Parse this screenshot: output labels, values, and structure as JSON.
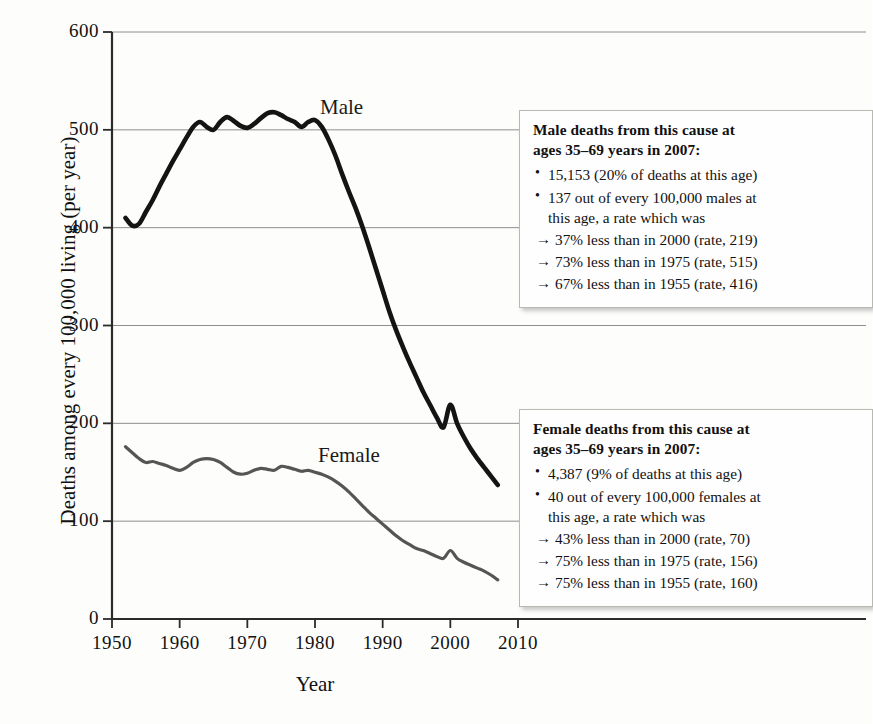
{
  "chart_data": {
    "type": "line",
    "title": "",
    "xlabel": "Year",
    "ylabel": "Deaths among every 100,000 living (per year)",
    "xlim": [
      1950,
      2012
    ],
    "ylim": [
      0,
      600
    ],
    "xticks": [
      "1950",
      "1960",
      "1970",
      "1980",
      "1990",
      "2000",
      "2010"
    ],
    "yticks": [
      "0",
      "100",
      "200",
      "300",
      "400",
      "500",
      "600"
    ],
    "grid": "horizontal",
    "legend_position": "inline-labels",
    "series": [
      {
        "name": "Male",
        "color": "#141414",
        "x": [
          1952,
          1953,
          1954,
          1955,
          1956,
          1957,
          1958,
          1959,
          1960,
          1961,
          1962,
          1963,
          1964,
          1965,
          1966,
          1967,
          1968,
          1969,
          1970,
          1971,
          1972,
          1973,
          1974,
          1975,
          1976,
          1977,
          1978,
          1979,
          1980,
          1981,
          1982,
          1983,
          1984,
          1985,
          1986,
          1987,
          1988,
          1989,
          1990,
          1991,
          1992,
          1993,
          1994,
          1995,
          1996,
          1997,
          1998,
          1999,
          2000,
          2001,
          2002,
          2003,
          2004,
          2005,
          2006,
          2007
        ],
        "values": [
          410,
          402,
          404,
          416,
          428,
          442,
          455,
          468,
          480,
          492,
          503,
          508,
          503,
          500,
          508,
          513,
          509,
          504,
          502,
          506,
          512,
          517,
          518,
          515,
          511,
          508,
          503,
          508,
          510,
          503,
          490,
          474,
          455,
          437,
          420,
          401,
          380,
          358,
          336,
          314,
          295,
          278,
          262,
          247,
          232,
          219,
          206,
          196,
          219,
          200,
          186,
          174,
          164,
          155,
          146,
          137
        ]
      },
      {
        "name": "Female",
        "color": "#555555",
        "x": [
          1952,
          1953,
          1954,
          1955,
          1956,
          1957,
          1958,
          1959,
          1960,
          1961,
          1962,
          1963,
          1964,
          1965,
          1966,
          1967,
          1968,
          1969,
          1970,
          1971,
          1972,
          1973,
          1974,
          1975,
          1976,
          1977,
          1978,
          1979,
          1980,
          1981,
          1982,
          1983,
          1984,
          1985,
          1986,
          1987,
          1988,
          1989,
          1990,
          1991,
          1992,
          1993,
          1994,
          1995,
          1996,
          1997,
          1998,
          1999,
          2000,
          2001,
          2002,
          2003,
          2004,
          2005,
          2006,
          2007
        ],
        "values": [
          176,
          170,
          164,
          160,
          161,
          159,
          157,
          154,
          152,
          155,
          160,
          163,
          164,
          163,
          160,
          155,
          150,
          148,
          149,
          152,
          154,
          153,
          152,
          156,
          155,
          153,
          151,
          152,
          150,
          148,
          145,
          141,
          136,
          130,
          123,
          116,
          109,
          103,
          97,
          91,
          85,
          80,
          76,
          72,
          70,
          67,
          64,
          62,
          70,
          62,
          58,
          55,
          52,
          49,
          45,
          40
        ]
      }
    ],
    "series_labels": [
      {
        "name": "Male",
        "text": "Male"
      },
      {
        "name": "Female",
        "text": "Female"
      }
    ]
  },
  "annotations": {
    "male": {
      "heading_line1": "Male deaths from this cause at",
      "heading_line2": "ages 35–69 years in 2007:",
      "items": [
        {
          "type": "bullet",
          "text": "15,153 (20% of deaths at this age)"
        },
        {
          "type": "bullet",
          "text": "137 out of every 100,000 males at",
          "sub": "this age, a rate which was"
        },
        {
          "type": "arrow",
          "text": "37% less than in 2000 (rate, 219)"
        },
        {
          "type": "arrow",
          "text": "73% less than in 1975 (rate, 515)"
        },
        {
          "type": "arrow",
          "text": "67% less than in 1955 (rate, 416)"
        }
      ]
    },
    "female": {
      "heading_line1": "Female deaths from this cause at",
      "heading_line2": "ages 35–69 years in 2007:",
      "items": [
        {
          "type": "bullet",
          "text": "4,387 (9% of deaths at this age)"
        },
        {
          "type": "bullet",
          "text": "40 out of every 100,000 females at",
          "sub": "this age, a rate which was"
        },
        {
          "type": "arrow",
          "text": "43% less than in 2000 (rate, 70)"
        },
        {
          "type": "arrow",
          "text": "75% less than in 1975 (rate, 156)"
        },
        {
          "type": "arrow",
          "text": "75% less than in 1955 (rate, 160)"
        }
      ]
    }
  }
}
